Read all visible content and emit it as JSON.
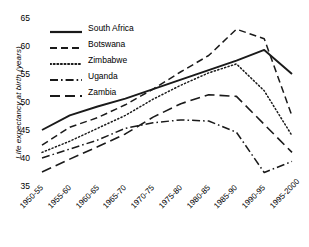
{
  "chart_data": {
    "type": "line",
    "title": "",
    "xlabel": "",
    "ylabel": "Life expectancy at birth (years)",
    "grid": false,
    "legend_position": "top-left",
    "ylim": [
      35,
      66
    ],
    "yticks": [
      35,
      40,
      45,
      50,
      55,
      60,
      65
    ],
    "categories": [
      "1950-55",
      "1955-60",
      "1960-65",
      "1965-70",
      "1970-75",
      "1975-80",
      "1980-85",
      "1985-90",
      "1990-95",
      "1995-2000"
    ],
    "series": [
      {
        "name": "South Africa",
        "style": "solid",
        "color": "#1a1a1a",
        "values": [
          45.0,
          47.6,
          49.2,
          50.6,
          52.3,
          54.0,
          55.7,
          57.4,
          59.3,
          55.0
        ]
      },
      {
        "name": "Botswana",
        "style": "dashed",
        "color": "#1a1a1a",
        "values": [
          42.3,
          45.5,
          47.2,
          49.5,
          52.3,
          55.4,
          58.3,
          63.0,
          61.3,
          47.5
        ]
      },
      {
        "name": "Zimbabwe",
        "style": "dotted",
        "color": "#1a1a1a",
        "values": [
          41.0,
          43.0,
          45.3,
          47.6,
          50.5,
          53.0,
          55.2,
          56.8,
          52.0,
          44.0
        ]
      },
      {
        "name": "Uganda",
        "style": "dashdot",
        "color": "#1a1a1a",
        "values": [
          40.0,
          41.6,
          43.2,
          45.3,
          46.3,
          46.8,
          46.6,
          44.6,
          37.4,
          39.4
        ]
      },
      {
        "name": "Zambia",
        "style": "longdash",
        "color": "#1a1a1a",
        "values": [
          37.5,
          39.8,
          42.0,
          44.3,
          47.3,
          49.7,
          51.3,
          51.0,
          46.0,
          41.0
        ]
      }
    ]
  },
  "legend": {
    "items": [
      {
        "label": "South Africa"
      },
      {
        "label": "Botswana"
      },
      {
        "label": "Zimbabwe"
      },
      {
        "label": "Uganda"
      },
      {
        "label": "Zambia"
      }
    ]
  }
}
